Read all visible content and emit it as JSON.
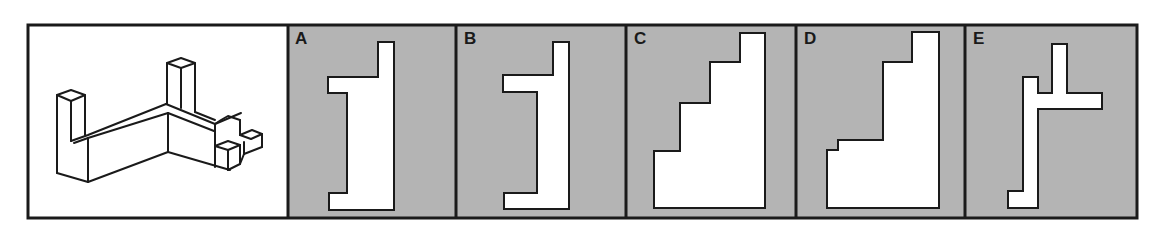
{
  "puzzle": {
    "reference_figure": {
      "description": "isometric 3D block object",
      "background": "#ffffff"
    },
    "options": [
      {
        "label": "A",
        "background": "#b4b4b4",
        "points": "378,42 394,42 394,210 329,210 329,193 347,193 347,93 328,93 328,77 378,77"
      },
      {
        "label": "B",
        "background": "#b4b4b4",
        "points": "553,42 569,42 569,209 504,209 504,193 537,193 537,92 503,92 503,75 553,75"
      },
      {
        "label": "C",
        "background": "#b4b4b4",
        "points": "740,33 765,33 765,208 654,208 654,151 680,151 680,103 710,103 710,62 740,62"
      },
      {
        "label": "D",
        "background": "#b4b4b4",
        "points": "912,32 939,32 939,208 827,208 827,150 838,150 838,140 883,140 883,62 912,62"
      },
      {
        "label": "E",
        "background": "#b4b4b4",
        "points": "1052,44 1067,44 1067,93 1102,93 1102,109 1038,109 1038,208 1008,208 1008,191 1023,191 1023,77 1038,77 1038,93 1052,93"
      }
    ],
    "colors": {
      "border": "#1a1a1a",
      "option_bg": "#b4b4b4",
      "shape_fill": "#ffffff"
    }
  }
}
